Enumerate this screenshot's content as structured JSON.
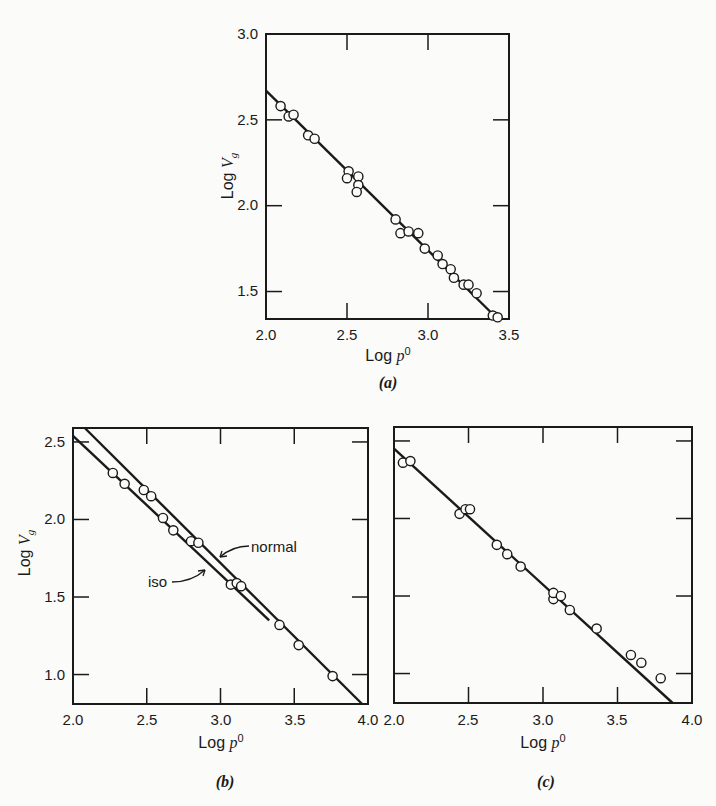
{
  "chart_data": [
    {
      "panel": "(a)",
      "type": "scatter",
      "title": "",
      "xlabel": "Log p⁰",
      "ylabel": "Log V_g",
      "xlim": [
        2.0,
        3.5
      ],
      "ylim": [
        1.34,
        3.0
      ],
      "xticks": [
        2.0,
        2.5,
        3.0,
        3.5
      ],
      "yticks": [
        1.5,
        2.0,
        2.5,
        3.0
      ],
      "grid": false,
      "points": [
        [
          2.09,
          2.58
        ],
        [
          2.14,
          2.52
        ],
        [
          2.17,
          2.53
        ],
        [
          2.26,
          2.41
        ],
        [
          2.3,
          2.39
        ],
        [
          2.51,
          2.2
        ],
        [
          2.5,
          2.16
        ],
        [
          2.57,
          2.17
        ],
        [
          2.57,
          2.12
        ],
        [
          2.56,
          2.08
        ],
        [
          2.8,
          1.92
        ],
        [
          2.83,
          1.84
        ],
        [
          2.88,
          1.85
        ],
        [
          2.94,
          1.84
        ],
        [
          2.98,
          1.75
        ],
        [
          3.06,
          1.71
        ],
        [
          3.09,
          1.66
        ],
        [
          3.14,
          1.63
        ],
        [
          3.16,
          1.58
        ],
        [
          3.22,
          1.54
        ],
        [
          3.25,
          1.54
        ],
        [
          3.3,
          1.49
        ],
        [
          3.4,
          1.36
        ],
        [
          3.43,
          1.35
        ]
      ],
      "lines": [
        {
          "name": "fit",
          "from": [
            2.0,
            2.67
          ],
          "to": [
            3.43,
            1.34
          ]
        }
      ]
    },
    {
      "panel": "(b)",
      "type": "scatter",
      "title": "",
      "xlabel": "Log p⁰",
      "ylabel": "Log V_g",
      "xlim": [
        2.0,
        4.0
      ],
      "ylim": [
        0.81,
        2.59
      ],
      "xticks": [
        2.0,
        2.5,
        3.0,
        3.5,
        4.0
      ],
      "yticks": [
        1.0,
        1.5,
        2.0,
        2.5
      ],
      "grid": false,
      "points": [
        [
          2.27,
          2.3
        ],
        [
          2.35,
          2.23
        ],
        [
          2.48,
          2.19
        ],
        [
          2.53,
          2.15
        ],
        [
          2.61,
          2.01
        ],
        [
          2.68,
          1.93
        ],
        [
          2.8,
          1.86
        ],
        [
          2.85,
          1.85
        ],
        [
          3.07,
          1.58
        ],
        [
          3.11,
          1.59
        ],
        [
          3.14,
          1.57
        ],
        [
          3.4,
          1.32
        ],
        [
          3.53,
          1.19
        ],
        [
          3.76,
          0.99
        ]
      ],
      "lines": [
        {
          "name": "iso",
          "from": [
            2.0,
            2.54
          ],
          "to": [
            3.33,
            1.35
          ]
        },
        {
          "name": "normal",
          "from": [
            2.08,
            2.59
          ],
          "to": [
            3.96,
            0.81
          ]
        }
      ],
      "annotations": [
        "normal",
        "iso"
      ]
    },
    {
      "panel": "(c)",
      "type": "scatter",
      "title": "",
      "xlabel": "Log p⁰",
      "ylabel": "",
      "xlim": [
        2.0,
        4.0
      ],
      "ylim": [
        0.81,
        2.59
      ],
      "xticks": [
        2.0,
        2.5,
        3.0,
        3.5,
        4.0
      ],
      "yticks": [
        1.0,
        1.5,
        2.0,
        2.5
      ],
      "grid": false,
      "points": [
        [
          2.06,
          2.36
        ],
        [
          2.11,
          2.37
        ],
        [
          2.44,
          2.03
        ],
        [
          2.48,
          2.06
        ],
        [
          2.51,
          2.06
        ],
        [
          2.69,
          1.83
        ],
        [
          2.76,
          1.77
        ],
        [
          2.85,
          1.69
        ],
        [
          3.07,
          1.48
        ],
        [
          3.07,
          1.52
        ],
        [
          3.12,
          1.5
        ],
        [
          3.18,
          1.41
        ],
        [
          3.36,
          1.29
        ],
        [
          3.59,
          1.12
        ],
        [
          3.66,
          1.07
        ],
        [
          3.79,
          0.97
        ]
      ],
      "lines": [
        {
          "name": "fit",
          "from": [
            2.0,
            2.45
          ],
          "to": [
            3.87,
            0.81
          ]
        }
      ]
    }
  ],
  "labels": {
    "a": {
      "panel": "(a)",
      "xlabel_main": "Log ",
      "xlabel_var": "p",
      "xlabel_sup": "0",
      "ylabel_main": "Log ",
      "ylabel_var": "V",
      "ylabel_sub": "g",
      "xticks": [
        "2.0",
        "2.5",
        "3.0",
        "3.5"
      ],
      "yticks": [
        "3.0",
        "2.5",
        "2.0",
        "1.5"
      ]
    },
    "b": {
      "panel": "(b)",
      "xlabel_main": "Log ",
      "xlabel_var": "p",
      "xlabel_sup": "0",
      "ylabel_main": "Log ",
      "ylabel_var": "V",
      "ylabel_sub": "g",
      "xticks": [
        "2.0",
        "2.5",
        "3.0",
        "3.5",
        "4.0"
      ],
      "yticks": [
        "2.5",
        "2.0",
        "1.5",
        "1.0"
      ],
      "annot_normal": "normal",
      "annot_iso": "iso"
    },
    "c": {
      "panel": "(c)",
      "xlabel_main": "Log ",
      "xlabel_var": "p",
      "xlabel_sup": "0",
      "xticks": [
        "2.0",
        "2.5",
        "3.0",
        "3.5",
        "4.0"
      ]
    }
  },
  "colors": {
    "ink": "#1a1a1a",
    "paper": "#fbfbf9"
  }
}
